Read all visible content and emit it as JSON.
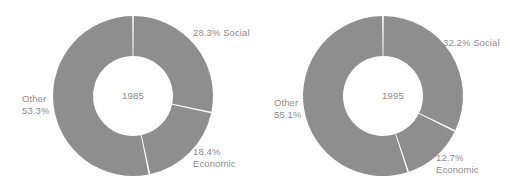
{
  "chart_data": [
    {
      "type": "pie",
      "title": "1985",
      "center_label": "1985",
      "subtype": "donut",
      "categories": [
        "Social",
        "Economic",
        "Other"
      ],
      "values": [
        28.3,
        18.4,
        53.3
      ],
      "unit": "%",
      "colors": {
        "slice": "#8e8e8e",
        "divider": "#ffffff",
        "text": "#8d8d8d"
      },
      "start_angle_deg": 0,
      "direction": "clockwise",
      "labels": [
        {
          "name": "social",
          "text": "28.3% Social",
          "value": 28.3,
          "category": "Social"
        },
        {
          "name": "economic",
          "text": "18.4%\nEconomic",
          "value": 18.4,
          "category": "Economic"
        },
        {
          "name": "other",
          "text": "Other\n53.3%",
          "value": 53.3,
          "category": "Other"
        }
      ],
      "legend": "none",
      "grid": false
    },
    {
      "type": "pie",
      "title": "1995",
      "center_label": "1995",
      "subtype": "donut",
      "categories": [
        "Social",
        "Economic",
        "Other"
      ],
      "values": [
        32.2,
        12.7,
        55.1
      ],
      "unit": "%",
      "colors": {
        "slice": "#8e8e8e",
        "divider": "#ffffff",
        "text": "#8d8d8d"
      },
      "start_angle_deg": 0,
      "direction": "clockwise",
      "labels": [
        {
          "name": "social",
          "text": "32.2% Social",
          "value": 32.2,
          "category": "Social"
        },
        {
          "name": "economic",
          "text": "12.7%\nEconomic",
          "value": 12.7,
          "category": "Economic"
        },
        {
          "name": "other",
          "text": "Other\n55.1%",
          "value": 55.1,
          "category": "Other"
        }
      ],
      "legend": "none",
      "grid": false
    }
  ],
  "charts": {
    "left": {
      "year": "1985",
      "social_label": "28.3% Social",
      "economic_label": "18.4%\nEconomic",
      "other_label": "Other\n53.3%"
    },
    "right": {
      "year": "1995",
      "social_label": "32.2% Social",
      "economic_label": "12.7%\nEconomic",
      "other_label": "Other\n55.1%"
    }
  }
}
